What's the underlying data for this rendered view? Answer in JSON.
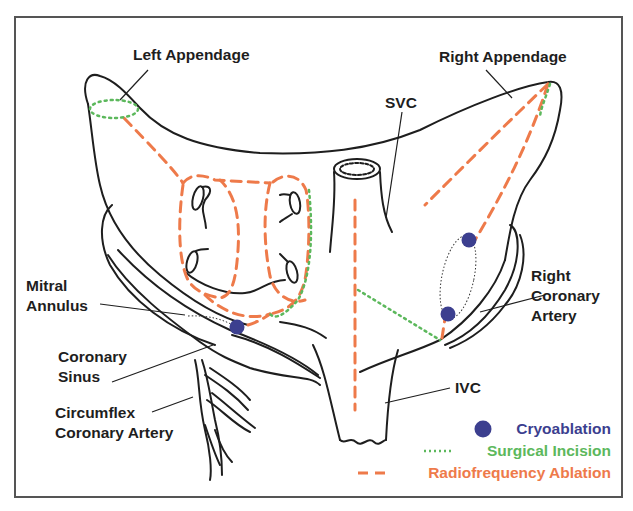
{
  "figure": {
    "type": "anatomical-diagram"
  },
  "labels": {
    "left_appendage": "Left Appendage",
    "right_appendage": "Right Appendage",
    "svc": "SVC",
    "mitral_annulus": [
      "Mitral",
      "Annulus"
    ],
    "right_coronary_artery": [
      "Right",
      "Coronary",
      "Artery"
    ],
    "coronary_sinus": [
      "Coronary",
      "Sinus"
    ],
    "circumflex_coronary_artery": [
      "Circumflex",
      "Coronary Artery"
    ],
    "ivc": "IVC"
  },
  "legend": {
    "items": [
      {
        "label": "Cryoablation",
        "symbol": "filled-circle",
        "color": "#3c3f8f"
      },
      {
        "label": "Surgical Incision",
        "symbol": "dotted-line",
        "color": "#5cb85c"
      },
      {
        "label": "Radiofrequency Ablation",
        "symbol": "dashed-line",
        "color": "#ee7a4a"
      }
    ]
  },
  "colors": {
    "outline": "#1e1e1e",
    "frame": "#555555",
    "cryo": "#3c3f8f",
    "surgical": "#5cb85c",
    "rf": "#ee7a4a"
  }
}
